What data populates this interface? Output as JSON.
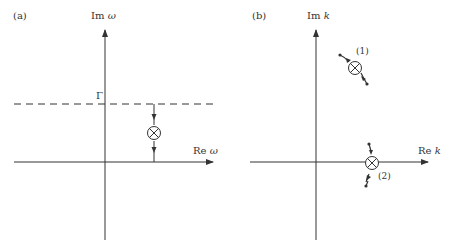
{
  "figure": {
    "panel_a": {
      "label": "(a)",
      "y_axis_label_prefix": "Im",
      "y_axis_label_var": "ω",
      "x_axis_label_prefix": "Re",
      "x_axis_label_var": "ω",
      "dashed_line_label": "Γ",
      "pole_symbol": "crossed-circle",
      "description": "Contour line at Im ω = Γ with pole moving downward toward real axis"
    },
    "panel_b": {
      "label": "(b)",
      "y_axis_label_prefix": "Im",
      "y_axis_label_var": "k",
      "x_axis_label_prefix": "Re",
      "x_axis_label_var": "k",
      "pole_1_label": "(1)",
      "pole_2_label": "(2)",
      "description": "Two poles in complex k-plane moving along trajectories; pole (2) crosses the real axis"
    },
    "colors": {
      "line": "#333333",
      "background": "#ffffff"
    }
  }
}
